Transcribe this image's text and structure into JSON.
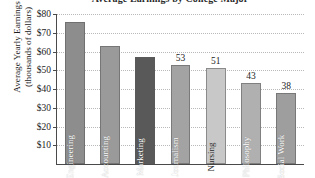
{
  "chart_data": {
    "type": "bar",
    "title": "Average Earnings by College Major",
    "xlabel": "",
    "ylabel": "Average Yearly Earnings (thousands of dollars)",
    "ylabel_line1": "Average Yearly Earnings",
    "ylabel_line2": "(thousands of dollars)",
    "categories": [
      "Engineering",
      "Accounting",
      "Marketing",
      "Journalism",
      "Nursing",
      "Philosophy",
      "Social Work"
    ],
    "values": [
      76,
      63,
      57,
      53,
      51,
      43,
      38
    ],
    "value_labels": [
      "",
      "",
      "",
      "53",
      "51",
      "43",
      "38"
    ],
    "bar_colors": [
      "#8d8d8d",
      "#9a9a9a",
      "#595959",
      "#a3a3a3",
      "#c8c8c8",
      "#b0b0b0",
      "#9e9e9e"
    ],
    "label_is_dark": [
      false,
      false,
      false,
      false,
      true,
      false,
      false
    ],
    "ylim": [
      0,
      80
    ],
    "yticks": [
      10,
      20,
      30,
      40,
      50,
      60,
      70,
      80
    ],
    "ytick_labels": [
      "$10",
      "$20",
      "$30",
      "$40",
      "$50",
      "$60",
      "$70",
      "$80"
    ],
    "grid": true,
    "legend": "none",
    "axis_color": "#4a4a4a",
    "gridline_color": "#b9b9b9"
  }
}
